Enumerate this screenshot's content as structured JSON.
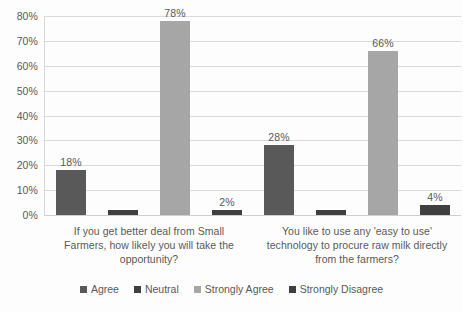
{
  "chart_data": {
    "type": "bar",
    "title": "",
    "subtitle": "",
    "xlabel": "",
    "ylabel": "",
    "ylim": [
      0,
      80
    ],
    "grid": true,
    "legend_position": "bottom",
    "tick_labels": [
      "0%",
      "10%",
      "20%",
      "30%",
      "40%",
      "50%",
      "60%",
      "70%",
      "80%"
    ],
    "tick_values": [
      0,
      10,
      20,
      30,
      40,
      50,
      60,
      70,
      80
    ],
    "categories": [
      "If you get better deal from Small Farmers, how likely you will take the opportunity?",
      "You like to use any 'easy to use' technology to procure raw milk directly from the farmers?"
    ],
    "category_lines": [
      [
        "If you get better deal from Small",
        "Farmers, how likely you will take the",
        "opportunity?"
      ],
      [
        "You like to use any 'easy to use'",
        "technology to procure raw milk directly",
        "from the farmers?"
      ]
    ],
    "series": [
      {
        "name": "Agree",
        "color": "#595959",
        "values": [
          18,
          28
        ],
        "labels": [
          "18%",
          "28%"
        ],
        "show_labels": [
          true,
          true
        ]
      },
      {
        "name": "Neutral",
        "color": "#3f3f3f",
        "values": [
          2,
          2
        ],
        "labels": [
          "2%",
          "2%"
        ],
        "show_labels": [
          false,
          false
        ]
      },
      {
        "name": "Strongly Agree",
        "color": "#a6a6a6",
        "values": [
          78,
          66
        ],
        "labels": [
          "78%",
          "66%"
        ],
        "show_labels": [
          true,
          true
        ]
      },
      {
        "name": "Strongly Disagree",
        "color": "#3f3f3f",
        "values": [
          2,
          4
        ],
        "labels": [
          "2%",
          "4%"
        ],
        "show_labels": [
          true,
          true
        ]
      }
    ]
  },
  "legend": {
    "items": [
      {
        "label": "Agree",
        "color": "#595959"
      },
      {
        "label": "Neutral",
        "color": "#3f3f3f"
      },
      {
        "label": "Strongly Agree",
        "color": "#a6a6a6"
      },
      {
        "label": "Strongly Disagree",
        "color": "#3f3f3f"
      }
    ]
  },
  "colors": {
    "gridline": "#d9d9d9",
    "text": "#595959",
    "background": "#fdfdfd"
  }
}
